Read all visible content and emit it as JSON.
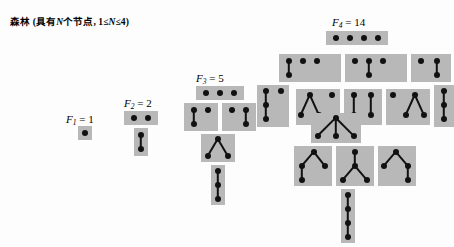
{
  "figure": {
    "caption": "森林 (具有N个节点, 1≤N≤4)",
    "caption_plain": "森林（具有N个节点，1≤N≤4）",
    "background_color": "#fdfdfd",
    "box_color": "#b8b8b8",
    "node_color": "#111111",
    "edge_color": "#111111",
    "width": 454,
    "height": 247
  },
  "groups": [
    {
      "id": "F1",
      "label": "F",
      "subscript": "1",
      "equals": "= 1",
      "label_full": "F₁ = 1",
      "count": 1,
      "label_x": 66,
      "label_y": 113,
      "boxes": [
        {
          "name": "forest-1-1",
          "x": 78,
          "y": 126,
          "w": 14,
          "h": 14,
          "nodes": [
            [
              7,
              7
            ]
          ],
          "edges": []
        }
      ]
    },
    {
      "id": "F2",
      "label": "F",
      "subscript": "2",
      "equals": "= 2",
      "label_full": "F₂ = 2",
      "count": 2,
      "label_x": 124,
      "label_y": 97,
      "boxes": [
        {
          "name": "forest-2-1",
          "x": 124,
          "y": 111,
          "w": 34,
          "h": 14,
          "nodes": [
            [
              10,
              7
            ],
            [
              24,
              7
            ]
          ],
          "edges": []
        },
        {
          "name": "forest-2-2",
          "x": 134,
          "y": 128,
          "w": 14,
          "h": 28,
          "nodes": [
            [
              7,
              7
            ],
            [
              7,
              21
            ]
          ],
          "edges": [
            [
              0,
              1
            ]
          ]
        }
      ]
    },
    {
      "id": "F3",
      "label": "F",
      "subscript": "3",
      "equals": "= 5",
      "label_full": "F₃ = 5",
      "count": 5,
      "label_x": 196,
      "label_y": 72,
      "boxes": [
        {
          "name": "forest-3-1",
          "x": 196,
          "y": 86,
          "w": 48,
          "h": 14,
          "nodes": [
            [
              10,
              7
            ],
            [
              24,
              7
            ],
            [
              38,
              7
            ]
          ],
          "edges": []
        },
        {
          "name": "forest-3-2",
          "x": 184,
          "y": 103,
          "w": 34,
          "h": 28,
          "nodes": [
            [
              10,
              7
            ],
            [
              10,
              21
            ],
            [
              24,
              7
            ]
          ],
          "edges": [
            [
              0,
              1
            ]
          ]
        },
        {
          "name": "forest-3-3",
          "x": 222,
          "y": 103,
          "w": 34,
          "h": 28,
          "nodes": [
            [
              10,
              7
            ],
            [
              24,
              7
            ],
            [
              24,
              21
            ]
          ],
          "edges": [
            [
              1,
              2
            ]
          ]
        },
        {
          "name": "forest-3-4",
          "x": 201,
          "y": 134,
          "w": 34,
          "h": 28,
          "nodes": [
            [
              17,
              5
            ],
            [
              7,
              22
            ],
            [
              27,
              22
            ]
          ],
          "edges": [
            [
              0,
              1
            ],
            [
              0,
              2
            ]
          ]
        },
        {
          "name": "forest-3-5",
          "x": 211,
          "y": 165,
          "w": 14,
          "h": 40,
          "nodes": [
            [
              7,
              6
            ],
            [
              7,
              20
            ],
            [
              7,
              34
            ]
          ],
          "edges": [
            [
              0,
              1
            ],
            [
              1,
              2
            ]
          ]
        }
      ]
    },
    {
      "id": "F4",
      "label": "F",
      "subscript": "4",
      "equals": "= 14",
      "label_full": "F₄ = 14",
      "count": 14,
      "label_x": 332,
      "label_y": 16,
      "boxes": [
        {
          "name": "forest-4-1",
          "x": 326,
          "y": 31,
          "w": 62,
          "h": 14,
          "nodes": [
            [
              10,
              7
            ],
            [
              24,
              7
            ],
            [
              38,
              7
            ],
            [
              52,
              7
            ]
          ],
          "edges": []
        },
        {
          "name": "forest-4-2",
          "x": 279,
          "y": 54,
          "w": 62,
          "h": 28,
          "nodes": [
            [
              10,
              7
            ],
            [
              10,
              21
            ],
            [
              24,
              7
            ],
            [
              38,
              7
            ]
          ],
          "edges": [
            [
              0,
              1
            ]
          ]
        },
        {
          "name": "forest-4-3",
          "x": 345,
          "y": 54,
          "w": 62,
          "h": 28,
          "nodes": [
            [
              10,
              7
            ],
            [
              24,
              7
            ],
            [
              24,
              21
            ],
            [
              38,
              7
            ]
          ],
          "edges": [
            [
              1,
              2
            ]
          ]
        },
        {
          "name": "forest-4-4",
          "x": 411,
          "y": 54,
          "w": 40,
          "h": 28,
          "nodes": [
            [
              10,
              7
            ],
            [
              26,
              7
            ],
            [
              26,
              21
            ]
          ],
          "edges": [
            [
              1,
              2
            ]
          ]
        },
        {
          "name": "forest-4-5",
          "x": 257,
          "y": 85,
          "w": 32,
          "h": 42,
          "nodes": [
            [
              9,
              6
            ],
            [
              9,
              20
            ],
            [
              9,
              34
            ],
            [
              24,
              6
            ]
          ],
          "edges": [
            [
              0,
              1
            ],
            [
              1,
              2
            ]
          ]
        },
        {
          "name": "forest-4-6",
          "x": 296,
          "y": 89,
          "w": 44,
          "h": 36,
          "nodes": [
            [
              14,
              6
            ],
            [
              5,
              26
            ],
            [
              23,
              26
            ],
            [
              36,
              6
            ]
          ],
          "edges": [
            [
              0,
              1
            ],
            [
              0,
              2
            ]
          ]
        },
        {
          "name": "forest-4-7",
          "x": 344,
          "y": 89,
          "w": 38,
          "h": 36,
          "nodes": [
            [
              10,
              6
            ],
            [
              10,
              26
            ],
            [
              27,
              6
            ],
            [
              27,
              26
            ]
          ],
          "edges": [
            [
              0,
              1
            ],
            [
              2,
              3
            ]
          ]
        },
        {
          "name": "forest-4-8",
          "x": 386,
          "y": 89,
          "w": 44,
          "h": 36,
          "nodes": [
            [
              7,
              6
            ],
            [
              29,
              6
            ],
            [
              20,
              26
            ],
            [
              38,
              26
            ]
          ],
          "edges": [
            [
              1,
              2
            ],
            [
              1,
              3
            ]
          ]
        },
        {
          "name": "forest-4-9",
          "x": 434,
          "y": 85,
          "w": 20,
          "h": 42,
          "nodes": [
            [
              10,
              6
            ],
            [
              10,
              20
            ],
            [
              10,
              34
            ]
          ],
          "edges": [
            [
              0,
              1
            ],
            [
              1,
              2
            ]
          ]
        },
        {
          "name": "forest-4-10",
          "x": 311,
          "y": 113,
          "w": 50,
          "h": 30,
          "nodes": [
            [
              25,
              5
            ],
            [
              7,
              23
            ],
            [
              25,
              23
            ],
            [
              43,
              23
            ]
          ],
          "edges": [
            [
              0,
              1
            ],
            [
              0,
              2
            ],
            [
              0,
              3
            ]
          ]
        },
        {
          "name": "forest-4-11",
          "x": 294,
          "y": 146,
          "w": 38,
          "h": 40,
          "nodes": [
            [
              20,
              6
            ],
            [
              8,
              20
            ],
            [
              31,
              20
            ],
            [
              8,
              34
            ]
          ],
          "edges": [
            [
              0,
              1
            ],
            [
              0,
              2
            ],
            [
              1,
              3
            ]
          ]
        },
        {
          "name": "forest-4-12",
          "x": 336,
          "y": 146,
          "w": 38,
          "h": 40,
          "nodes": [
            [
              19,
              6
            ],
            [
              19,
              20
            ],
            [
              7,
              34
            ],
            [
              31,
              34
            ]
          ],
          "edges": [
            [
              0,
              1
            ],
            [
              1,
              2
            ],
            [
              1,
              3
            ]
          ]
        },
        {
          "name": "forest-4-13",
          "x": 378,
          "y": 146,
          "w": 38,
          "h": 40,
          "nodes": [
            [
              18,
              6
            ],
            [
              6,
              20
            ],
            [
              30,
              20
            ],
            [
              30,
              34
            ]
          ],
          "edges": [
            [
              0,
              1
            ],
            [
              0,
              2
            ],
            [
              2,
              3
            ]
          ]
        },
        {
          "name": "forest-4-14",
          "x": 341,
          "y": 189,
          "w": 14,
          "h": 54,
          "nodes": [
            [
              7,
              6
            ],
            [
              7,
              20
            ],
            [
              7,
              34
            ],
            [
              7,
              48
            ]
          ],
          "edges": [
            [
              0,
              1
            ],
            [
              1,
              2
            ],
            [
              2,
              3
            ]
          ]
        }
      ]
    }
  ]
}
